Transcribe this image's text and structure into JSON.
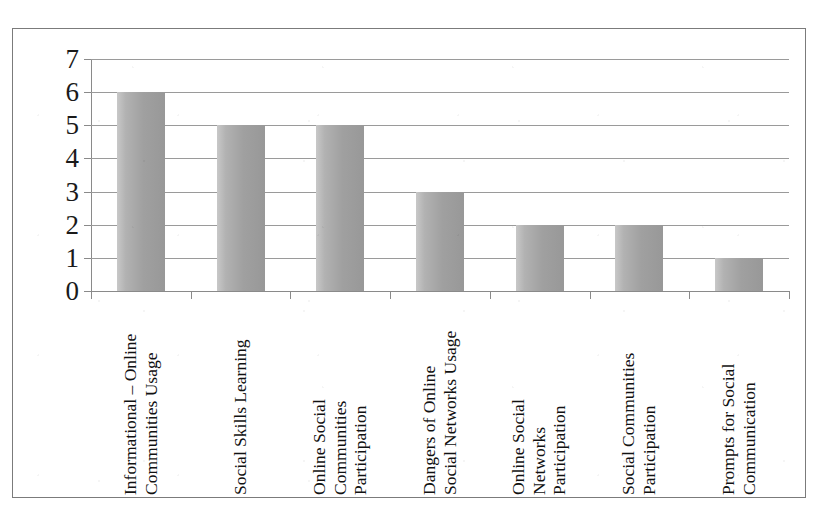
{
  "chart_data": {
    "type": "bar",
    "title": "",
    "subtitle": "",
    "xlabel": "",
    "ylabel": "",
    "ylim": [
      0,
      7
    ],
    "y_ticks": [
      "0",
      "1",
      "2",
      "3",
      "4",
      "5",
      "6",
      "7"
    ],
    "grid": true,
    "legend": false,
    "legend_position": "none",
    "orientation": "vertical",
    "categories": [
      "Informational – Online Communities Usage",
      "Social Skills Learning",
      "Online Social Communities Participation",
      "Dangers of Online Social Networks Usage",
      "Online Social Networks Participation",
      "Social Communities Participation",
      "Prompts for Social Communication"
    ],
    "category_lines": [
      [
        "Informational – Online",
        "Communities Usage"
      ],
      [
        "Social Skills Learning"
      ],
      [
        "Online Social",
        "Communities",
        "Participation"
      ],
      [
        "Dangers of Online",
        "Social Networks Usage"
      ],
      [
        "Online Social",
        "Networks",
        "Participation"
      ],
      [
        "Social Communities",
        "Participation"
      ],
      [
        "Prompts for Social",
        "Communication"
      ]
    ],
    "values": [
      6,
      5,
      5,
      3,
      2,
      2,
      1
    ],
    "series": [
      {
        "name": "Count",
        "values": [
          6,
          5,
          5,
          3,
          2,
          2,
          1
        ]
      }
    ],
    "bar_color": "#a8a8a8",
    "grid_color": "#9a9a9a",
    "axis_color": "#8a8a8a",
    "border_color": "#7b7b7b",
    "text_color": "#111111",
    "background_color": "#ffffff"
  }
}
